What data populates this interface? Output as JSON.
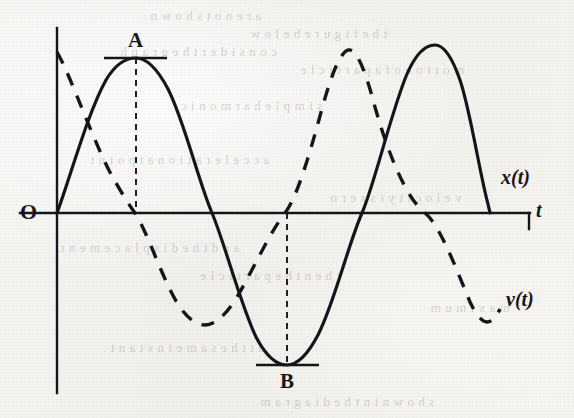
{
  "figure": {
    "kind": "scanned-textbook-figure",
    "background_color": "#f3f2ef",
    "ink_color": "#16161a",
    "width": 574,
    "height": 418
  },
  "axes": {
    "origin_label": "O",
    "x_axis_label": "t",
    "x_axis_label_style": "italic",
    "y_axis_label": "",
    "origin_px": {
      "x": 57,
      "y": 213
    },
    "x_axis_from_px": 20,
    "x_axis_to_px": 530,
    "y_axis_top_px": 28,
    "y_axis_bottom_px": 393
  },
  "curves": {
    "displacement": {
      "label": "x(t)",
      "style": "solid",
      "label_pos_px": {
        "x": 500,
        "y": 170
      }
    },
    "velocity": {
      "label": "v(t)",
      "style": "dashed",
      "label_pos_px": {
        "x": 506,
        "y": 292
      }
    }
  },
  "annotations": [
    {
      "label": "A",
      "description": "maximum-displacement marker on x(t) first crest",
      "label_pos_px": {
        "x": 128,
        "y": 30
      },
      "marker_line": {
        "x1": 104,
        "x2": 167,
        "y": 58
      },
      "drop_line": {
        "x": 136,
        "y1": 58,
        "y2": 213
      }
    },
    {
      "label": "B",
      "description": "minimum-displacement marker on x(t) trough",
      "label_pos_px": {
        "x": 280,
        "y": 371
      },
      "marker_line": {
        "x1": 256,
        "x2": 319,
        "y": 365
      },
      "drop_line": {
        "x": 287,
        "y1": 213,
        "y2": 365
      }
    }
  ],
  "chart_data": {
    "type": "line",
    "title": "",
    "xlabel": "t",
    "ylabel": "",
    "grid": false,
    "legend": "inline-curve-labels",
    "x_range_px": [
      57,
      500
    ],
    "amplitude_px": {
      "x_of_t": 155,
      "v_of_t": 162
    },
    "series": [
      {
        "name": "x(t)",
        "style": "solid",
        "form": "sine",
        "phase": "starts at origin rising",
        "period_px": 305,
        "key_points": [
          {
            "t_px": 57,
            "y_px": 213,
            "kind": "zero-rising"
          },
          {
            "t_px": 136,
            "y_px": 58,
            "kind": "maximum",
            "marker": "A"
          },
          {
            "t_px": 212,
            "y_px": 213,
            "kind": "zero-falling"
          },
          {
            "t_px": 287,
            "y_px": 365,
            "kind": "minimum",
            "marker": "B"
          },
          {
            "t_px": 362,
            "y_px": 213,
            "kind": "zero-rising"
          },
          {
            "t_px": 435,
            "y_px": 45,
            "kind": "maximum"
          },
          {
            "t_px": 490,
            "y_px": 213,
            "kind": "end"
          }
        ]
      },
      {
        "name": "v(t)",
        "style": "dashed",
        "form": "cosine",
        "phase": "leads x(t) by quarter period",
        "period_px": 305,
        "key_points": [
          {
            "t_px": 57,
            "y_px": 52,
            "kind": "start-near-maximum"
          },
          {
            "t_px": 135,
            "y_px": 213,
            "kind": "zero-falling"
          },
          {
            "t_px": 205,
            "y_px": 325,
            "kind": "minimum"
          },
          {
            "t_px": 285,
            "y_px": 213,
            "kind": "zero-rising"
          },
          {
            "t_px": 348,
            "y_px": 50,
            "kind": "maximum"
          },
          {
            "t_px": 425,
            "y_px": 213,
            "kind": "zero-falling"
          },
          {
            "t_px": 487,
            "y_px": 322,
            "kind": "minimum"
          },
          {
            "t_px": 500,
            "y_px": 310,
            "kind": "end"
          }
        ]
      }
    ]
  },
  "bleed_through_lines": [
    {
      "x": 150,
      "y": 8,
      "text": "a r e n o t s h o w n"
    },
    {
      "x": 250,
      "y": 26,
      "text": "t h e f i g u r e b e l o w"
    },
    {
      "x": 120,
      "y": 44,
      "text": "c o n s i d e r t h e g r a p h"
    },
    {
      "x": 300,
      "y": 62,
      "text": "m o t i o n o f a p a r t i c l e"
    },
    {
      "x": 180,
      "y": 98,
      "text": "s i m p l e h a r m o n i c"
    },
    {
      "x": 90,
      "y": 152,
      "text": "a c c e l e r a t i o n a t p o i n t"
    },
    {
      "x": 330,
      "y": 190,
      "text": "v e l o c i t y i s z e r o"
    },
    {
      "x": 60,
      "y": 240,
      "text": "a n d t h e d i s p l a c e m e n t"
    },
    {
      "x": 200,
      "y": 268,
      "text": "t h e n t h e p a r t i c l e"
    },
    {
      "x": 430,
      "y": 300,
      "text": "m a x i m u m"
    },
    {
      "x": 110,
      "y": 340,
      "text": "a t t h e s a m e i n s t a n t"
    },
    {
      "x": 260,
      "y": 394,
      "text": "s h o w n i n t h e d i a g r a m"
    }
  ]
}
